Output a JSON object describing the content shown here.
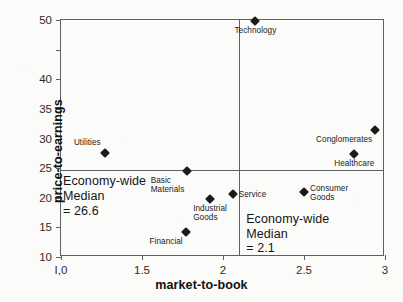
{
  "chart_data": {
    "type": "scatter",
    "title": "",
    "xlabel": "market-to-book",
    "ylabel": "price-to-earnings",
    "xlim": [
      1.0,
      3.0
    ],
    "ylim": [
      10,
      50
    ],
    "grid": false,
    "legend": "none",
    "xticks": [
      {
        "value": 1.0,
        "label": "I,0"
      },
      {
        "value": 1.5,
        "label": "1.5"
      },
      {
        "value": 2.0,
        "label": "2"
      },
      {
        "value": 2.5,
        "label": "2.5"
      },
      {
        "value": 3.0,
        "label": "3"
      }
    ],
    "yticks": [
      {
        "value": 50,
        "label": "50"
      },
      {
        "value": 45,
        "label": ""
      },
      {
        "value": 40,
        "label": "40"
      },
      {
        "value": 35,
        "label": "35"
      },
      {
        "value": 30,
        "label": "30"
      },
      {
        "value": 25,
        "label": "25"
      },
      {
        "value": 20,
        "label": "20"
      },
      {
        "value": 15,
        "label": "15"
      },
      {
        "value": 10,
        "label": "10"
      }
    ],
    "points": [
      {
        "name": "Technology",
        "x": 2.2,
        "y": 49.8,
        "label": "Technology",
        "label_pos": "below"
      },
      {
        "name": "Conglomerates",
        "x": 2.94,
        "y": 31.5,
        "label": "Conglomerates",
        "label_pos": "below-left"
      },
      {
        "name": "Healthcare",
        "x": 2.81,
        "y": 27.3,
        "label": "Healthcare",
        "label_pos": "below"
      },
      {
        "name": "Utilities",
        "x": 1.27,
        "y": 27.6,
        "label": "Utilities",
        "label_pos": "above-left"
      },
      {
        "name": "Basic Materials",
        "x": 1.78,
        "y": 24.5,
        "label": "Basic\nMaterials",
        "label_pos": "below-left"
      },
      {
        "name": "Service",
        "x": 2.06,
        "y": 20.6,
        "label": "Service",
        "label_pos": "right"
      },
      {
        "name": "Consumer Goods",
        "x": 2.5,
        "y": 20.9,
        "label": "Consumer\nGoods",
        "label_pos": "right"
      },
      {
        "name": "Industrial Goods",
        "x": 1.92,
        "y": 19.8,
        "label": "Industrial\nGoods",
        "label_pos": "below"
      },
      {
        "name": "Financial",
        "x": 1.77,
        "y": 14.3,
        "label": "Financial",
        "label_pos": "below-left"
      }
    ],
    "reference_lines": [
      {
        "orientation": "horizontal",
        "axis": "price-to-earnings",
        "value": 24.6,
        "annotation": "Economy-wide\nMedian\n= 26.6",
        "annotation_value": "26.6"
      },
      {
        "orientation": "vertical",
        "axis": "market-to-book",
        "value": 2.1,
        "annotation": "Economy-wide\nMedian\n= 2.1",
        "annotation_value": "2.1"
      }
    ],
    "annotations": [
      {
        "id": "pe-median",
        "text": "Economy-wide\nMedian\n= 26.6"
      },
      {
        "id": "mb-median",
        "text": "Economy-wide\nMedian\n= 2.1"
      }
    ],
    "colors": {
      "marker": "#1b1b1b",
      "axis": "#5d6166",
      "text": "#151515",
      "background": "#fbfbfa"
    }
  }
}
